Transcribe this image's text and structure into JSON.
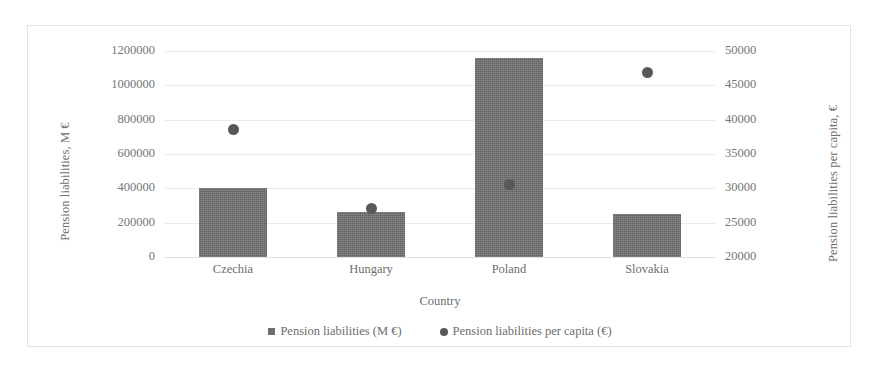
{
  "chart_data": {
    "type": "bar",
    "title": "",
    "subtitle": "",
    "xlabel": "Country",
    "ylabel": "Pension liabilities, M €",
    "y2label": "Pension liabilities per capita, €",
    "categories": [
      "Czechia",
      "Hungary",
      "Poland",
      "Slovakia"
    ],
    "series": [
      {
        "name": "Pension liabilities (M €)",
        "type": "bar",
        "axis": "left",
        "color": "#6e6e6e",
        "marker": "square",
        "values": [
          400000,
          260000,
          1160000,
          250000
        ]
      },
      {
        "name": "Pension liabilities per capita (€)",
        "type": "scatter",
        "axis": "right",
        "color": "#585858",
        "marker": "circle",
        "values": [
          38600,
          27100,
          30600,
          46800
        ]
      }
    ],
    "ylim": [
      0,
      1200000
    ],
    "yticks": [
      0,
      200000,
      400000,
      600000,
      800000,
      1000000,
      1200000
    ],
    "ytick_labels": [
      "0",
      "200000",
      "400000",
      "600000",
      "800000",
      "1000000",
      "1200000"
    ],
    "y2lim": [
      20000,
      50000
    ],
    "y2ticks": [
      20000,
      25000,
      30000,
      35000,
      40000,
      45000,
      50000
    ],
    "y2tick_labels": [
      "20000",
      "25000",
      "30000",
      "35000",
      "40000",
      "45000",
      "50000"
    ],
    "grid": true,
    "grid_axis": "y",
    "legend_position": "bottom",
    "background": "#ffffff",
    "frame_color": "#e2e2e2",
    "gridline_color": "#ececec"
  }
}
